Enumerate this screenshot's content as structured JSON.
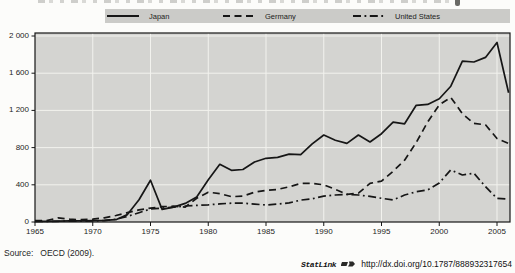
{
  "chart_data": {
    "type": "line",
    "x": [
      1965,
      1966,
      1967,
      1968,
      1969,
      1970,
      1971,
      1972,
      1973,
      1974,
      1975,
      1976,
      1977,
      1978,
      1979,
      1980,
      1981,
      1982,
      1983,
      1984,
      1985,
      1986,
      1987,
      1988,
      1989,
      1990,
      1991,
      1992,
      1993,
      1994,
      1995,
      1996,
      1997,
      1998,
      1999,
      2000,
      2001,
      2002,
      2003,
      2004,
      2005,
      2006
    ],
    "series": [
      {
        "name": "Japan",
        "style": "solid",
        "values": [
          8,
          8,
          10,
          12,
          12,
          15,
          18,
          25,
          80,
          240,
          450,
          135,
          160,
          200,
          270,
          455,
          620,
          556,
          565,
          645,
          685,
          695,
          730,
          725,
          840,
          935,
          880,
          845,
          935,
          860,
          950,
          1073,
          1056,
          1255,
          1265,
          1325,
          1460,
          1730,
          1720,
          1770,
          1930,
          1390
        ]
      },
      {
        "name": "Germany",
        "style": "dashed",
        "values": [
          15,
          15,
          45,
          30,
          25,
          30,
          45,
          70,
          100,
          130,
          150,
          165,
          170,
          160,
          255,
          320,
          305,
          272,
          278,
          320,
          340,
          350,
          378,
          415,
          415,
          400,
          350,
          298,
          310,
          415,
          440,
          545,
          665,
          855,
          1075,
          1260,
          1340,
          1165,
          1060,
          1045,
          898,
          845
        ]
      },
      {
        "name": "United States",
        "style": "dashdot",
        "values": [
          5,
          5,
          8,
          10,
          10,
          12,
          15,
          30,
          60,
          100,
          140,
          150,
          160,
          172,
          178,
          185,
          195,
          202,
          202,
          192,
          183,
          192,
          205,
          235,
          250,
          278,
          290,
          297,
          290,
          275,
          255,
          237,
          290,
          325,
          345,
          420,
          560,
          505,
          525,
          380,
          255,
          245
        ]
      }
    ],
    "ylim": [
      0,
      2000
    ],
    "y_tick_values": [
      0,
      400,
      800,
      1200,
      1600,
      2000
    ],
    "y_tick_labels": [
      "0",
      "400",
      "800",
      "1 200",
      "1 600",
      "2 000"
    ],
    "x_tick_values": [
      1965,
      1970,
      1975,
      1980,
      1985,
      1990,
      1995,
      2000,
      2005
    ],
    "grid": true,
    "legend_position": "top",
    "line_color": "#161616",
    "plot_bg": "#d4d4d1"
  },
  "footer": {
    "source_label": "Source:",
    "source_value": "OECD (2009).",
    "statlink_label": "StatLink",
    "statlink_url": "http://dx.doi.org/10.1787/888932317654"
  }
}
